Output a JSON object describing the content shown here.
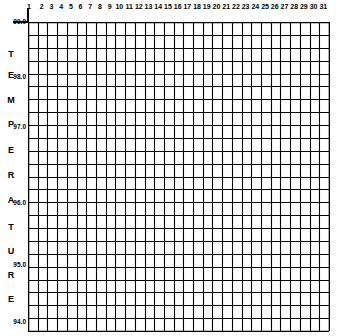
{
  "chart_data": {
    "type": "table",
    "title": "",
    "xlabel": "",
    "ylabel": "TEMPERATURE",
    "grid": true,
    "columns": 31,
    "rows": 24,
    "x_ticks": [
      "1",
      "2",
      "3",
      "4",
      "5",
      "6",
      "7",
      "8",
      "9",
      "10",
      "11",
      "12",
      "13",
      "14",
      "15",
      "16",
      "17",
      "18",
      "19",
      "20",
      "21",
      "22",
      "23",
      "24",
      "25",
      "26",
      "27",
      "28",
      "29",
      "30",
      "31"
    ],
    "y_ticks": [
      {
        "label": "99.0",
        "y": 22
      },
      {
        "label": "98.0",
        "y": 77
      },
      {
        "label": "97.0",
        "y": 127
      },
      {
        "label": "96.0",
        "y": 203
      },
      {
        "label": "95.0",
        "y": 265
      },
      {
        "label": "94.0",
        "y": 322
      }
    ],
    "ylim": [
      94.0,
      99.0
    ],
    "values": []
  },
  "axis": {
    "ylabel_letters": [
      {
        "char": "T",
        "y": 54
      },
      {
        "char": "E",
        "y": 75
      },
      {
        "char": "M",
        "y": 100
      },
      {
        "char": "P",
        "y": 124
      },
      {
        "char": "E",
        "y": 150
      },
      {
        "char": "R",
        "y": 175
      },
      {
        "char": "A",
        "y": 200
      },
      {
        "char": "T",
        "y": 227
      },
      {
        "char": "U",
        "y": 251
      },
      {
        "char": "R",
        "y": 275
      },
      {
        "char": "E",
        "y": 299
      }
    ]
  },
  "colors": {
    "line": "#000000",
    "background": "#ffffff"
  }
}
